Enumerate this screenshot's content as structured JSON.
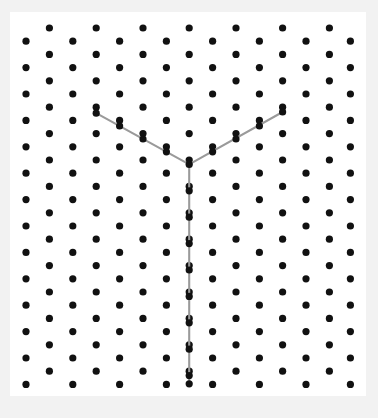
{
  "figure": {
    "canvas": {
      "width": 378,
      "height": 418,
      "page_background": "#f2f2f2",
      "plot_background": "#ffffff",
      "plot_x": 10,
      "plot_y": 12,
      "plot_width": 356,
      "plot_height": 384
    },
    "lattice": {
      "type": "triangular-hexagonal",
      "dot_color": "#111111",
      "dot_radius": 3.6,
      "column_spacing": 23.4,
      "row_spacing": 26.4,
      "column_count": 15,
      "first_column_x": 26,
      "tall_column_first_y": 28,
      "short_column_first_y": 41.2,
      "tall_column_rows": 15,
      "short_column_rows": 14,
      "tall_column_parity": "odd",
      "note": "Columns alternate vertical offset by half a row; odd-indexed columns start higher and carry one extra dot."
    },
    "path": {
      "name": "y-shape",
      "stroke_color": "#9a9a9a",
      "stroke_width": 2.1,
      "line_cap": "round",
      "line_join": "round",
      "vertex": {
        "x": 189.2,
        "y": 164.4
      },
      "segments": [
        {
          "name": "upper-left-arm",
          "from": {
            "x": 96.2,
            "y": 113.2
          },
          "to": {
            "x": 189.2,
            "y": 164.4
          }
        },
        {
          "name": "upper-right-arm",
          "from": {
            "x": 189.2,
            "y": 164.4
          },
          "to": {
            "x": 282.6,
            "y": 112.0
          }
        },
        {
          "name": "lower-stem",
          "from": {
            "x": 189.2,
            "y": 164.4
          },
          "to": {
            "x": 189.2,
            "y": 383.8
          }
        }
      ]
    }
  },
  "chart_data": {
    "type": "scatter",
    "subtitle": "",
    "xlabel": "",
    "ylabel": "",
    "xlim": [
      10,
      366
    ],
    "ylim": [
      12,
      396
    ],
    "grid": false,
    "legend": "none",
    "annotations": [
      "Gray Y-shaped polyline drawn over the lattice",
      "Arms meet at a single interior lattice point",
      "Stem runs straight down to the bottom row"
    ],
    "series": [
      {
        "name": "lattice-dots",
        "marker": "circle",
        "color": "#111111",
        "size": 7.2,
        "count": 218,
        "columns": [
          {
            "index": 0,
            "x": 26.0,
            "y_start": 41.2,
            "y_step": 26.4,
            "n": 14
          },
          {
            "index": 1,
            "x": 49.4,
            "y_start": 28.0,
            "y_step": 26.4,
            "n": 15
          },
          {
            "index": 2,
            "x": 72.8,
            "y_start": 41.2,
            "y_step": 26.4,
            "n": 14
          },
          {
            "index": 3,
            "x": 96.2,
            "y_start": 28.0,
            "y_step": 26.4,
            "n": 15
          },
          {
            "index": 4,
            "x": 119.6,
            "y_start": 41.2,
            "y_step": 26.4,
            "n": 14
          },
          {
            "index": 5,
            "x": 143.0,
            "y_start": 28.0,
            "y_step": 26.4,
            "n": 15
          },
          {
            "index": 6,
            "x": 166.4,
            "y_start": 41.2,
            "y_step": 26.4,
            "n": 14
          },
          {
            "index": 7,
            "x": 189.2,
            "y_start": 28.0,
            "y_step": 26.4,
            "n": 15
          },
          {
            "index": 8,
            "x": 212.6,
            "y_start": 41.2,
            "y_step": 26.4,
            "n": 14
          },
          {
            "index": 9,
            "x": 236.0,
            "y_start": 28.0,
            "y_step": 26.4,
            "n": 15
          },
          {
            "index": 10,
            "x": 259.4,
            "y_start": 41.2,
            "y_step": 26.4,
            "n": 14
          },
          {
            "index": 11,
            "x": 282.6,
            "y_start": 28.0,
            "y_step": 26.4,
            "n": 15
          },
          {
            "index": 12,
            "x": 306.0,
            "y_start": 41.2,
            "y_step": 26.4,
            "n": 14
          },
          {
            "index": 13,
            "x": 329.4,
            "y_start": 28.0,
            "y_step": 26.4,
            "n": 15
          },
          {
            "index": 14,
            "x": 350.4,
            "y_start": 41.2,
            "y_step": 26.4,
            "n": 14
          }
        ]
      },
      {
        "name": "y-path",
        "marker": "line",
        "color": "#9a9a9a",
        "points": [
          [
            96.2,
            113.2
          ],
          [
            189.2,
            164.4
          ],
          [
            282.6,
            112.0
          ]
        ],
        "extra_points": [
          [
            189.2,
            164.4
          ],
          [
            189.2,
            383.8
          ]
        ]
      }
    ]
  }
}
